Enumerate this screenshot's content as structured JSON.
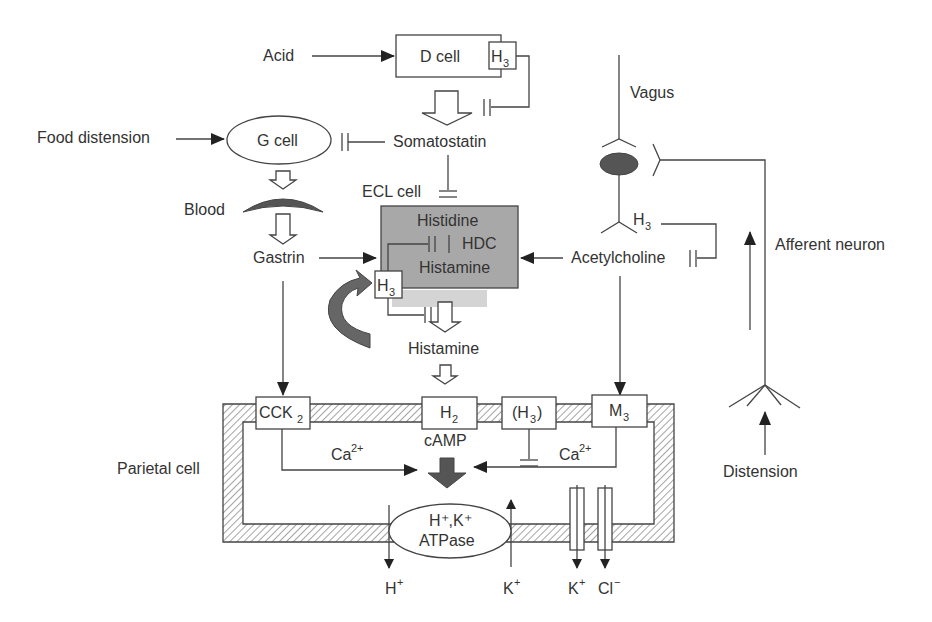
{
  "diagram": {
    "colors": {
      "ecl_fill": "#a8a8a8",
      "ecl_shadow": "#d4d4d4",
      "dark": "#555555",
      "line": "#444444"
    },
    "inputs": {
      "acid": "Acid",
      "food_distension": "Food distension",
      "distension": "Distension"
    },
    "cells": {
      "d_cell": "D cell",
      "g_cell": "G cell",
      "ecl_cell": "ECL cell",
      "parietal_cell": "Parietal cell"
    },
    "mediators": {
      "somatostatin": "Somatostatin",
      "blood": "Blood",
      "gastrin": "Gastrin",
      "histamine": "Histamine",
      "acetylcholine": "Acetylcholine"
    },
    "ecl_content": {
      "histidine": "Histidine",
      "hdc": "HDC",
      "histamine": "Histamine"
    },
    "neurons": {
      "vagus": "Vagus",
      "afferent": "Afferent neuron"
    },
    "receptors": {
      "h3": {
        "main": "H",
        "sub": "3"
      },
      "h3_paren": {
        "open": "(H",
        "sub": "3",
        "close": ")"
      },
      "cck2": {
        "main": "CCK",
        "sub": "2"
      },
      "h2": {
        "main": "H",
        "sub": "2"
      },
      "m3": {
        "main": "M",
        "sub": "3"
      }
    },
    "second_messengers": {
      "ca_left": {
        "main": "Ca",
        "sup": "2+"
      },
      "ca_right": {
        "main": "Ca",
        "sup": "2+"
      },
      "camp": "cAMP"
    },
    "pump": {
      "line1": "H⁺,K⁺",
      "line2": "ATPase"
    },
    "ions": {
      "h_out": {
        "main": "H",
        "sup": "+"
      },
      "k_in": {
        "main": "K",
        "sup": "+"
      },
      "k_out": {
        "main": "K",
        "sup": "+"
      },
      "cl_out": {
        "main": "Cl",
        "sup": "−"
      }
    }
  }
}
